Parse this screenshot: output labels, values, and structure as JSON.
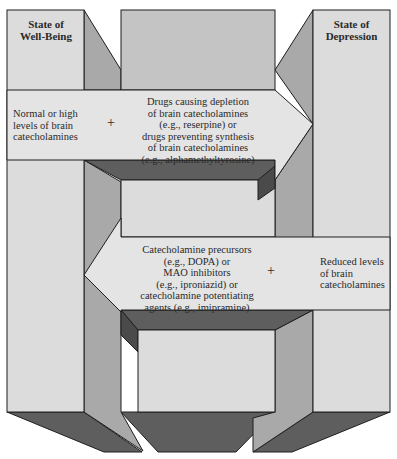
{
  "diagram": {
    "left_panel_title": [
      "State of",
      "Well-Being"
    ],
    "right_panel_title": [
      "State of",
      "Depression"
    ],
    "top_arrow": {
      "left_text": [
        "Normal or high",
        "levels of brain",
        "catecholamines"
      ],
      "operator": "+",
      "right_text": [
        "Drugs causing depletion",
        "of brain catecholamines",
        "(e.g., reserpine) or",
        "drugs preventing synthesis",
        "of brain catecholamines",
        "(e.g., alphamethyltyrosine)"
      ],
      "direction": "right"
    },
    "bottom_arrow": {
      "left_text": [
        "Catecholamine precursors",
        "(e.g., DOPA) or",
        "MAO inhibitors",
        "(e.g., iproniazid) or",
        "catecholamine potentiating",
        "agents (e.g., imipramine)"
      ],
      "operator": "+",
      "right_text": [
        "Reduced levels",
        "of brain",
        "catecholamines"
      ],
      "direction": "left"
    },
    "colors": {
      "light_face": "#dcdcdc",
      "mid_face": "#c4c4c4",
      "side_face": "#a9a9a9",
      "dark_face": "#5e5e5e",
      "outline": "#1e1e1e"
    }
  }
}
